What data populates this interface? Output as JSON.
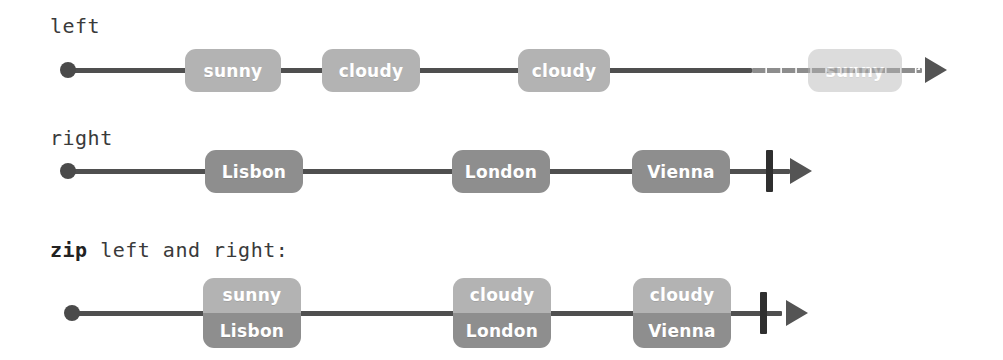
{
  "diagram": {
    "colors": {
      "marble_left": "#b3b3b3",
      "marble_right": "#8e8e8e",
      "line": "#4f4f4f",
      "dot": "#4a4a4a",
      "arrow": "#545454",
      "complete_bar": "#2f2f2f",
      "label_text": "#3a3a3a",
      "marble_text": "#ffffff",
      "background": "#ffffff"
    },
    "rows": [
      {
        "id": "left",
        "label_plain": "left",
        "label_keyword": "",
        "label_rest": "left",
        "completed": false,
        "dashed_tail": true,
        "marbles": [
          {
            "id": "left-sunny-1",
            "lines": [
              "sunny"
            ],
            "tone": "left",
            "faded": false
          },
          {
            "id": "left-cloudy-1",
            "lines": [
              "cloudy"
            ],
            "tone": "left",
            "faded": false
          },
          {
            "id": "left-cloudy-2",
            "lines": [
              "cloudy"
            ],
            "tone": "left",
            "faded": false
          },
          {
            "id": "left-sunny-2",
            "lines": [
              "sunny"
            ],
            "tone": "left",
            "faded": true
          }
        ]
      },
      {
        "id": "right",
        "label_plain": "right",
        "label_keyword": "",
        "label_rest": "right",
        "completed": true,
        "dashed_tail": false,
        "marbles": [
          {
            "id": "right-lisbon",
            "lines": [
              "Lisbon"
            ],
            "tone": "right",
            "faded": false
          },
          {
            "id": "right-london",
            "lines": [
              "London"
            ],
            "tone": "right",
            "faded": false
          },
          {
            "id": "right-vienna",
            "lines": [
              "Vienna"
            ],
            "tone": "right",
            "faded": false
          }
        ]
      },
      {
        "id": "zip",
        "label_plain": "zip left and right:",
        "label_keyword": "zip",
        "label_rest": " left and right:",
        "completed": true,
        "dashed_tail": false,
        "marbles": [
          {
            "id": "zip-1",
            "lines": [
              "sunny",
              "Lisbon"
            ],
            "tone": "pair",
            "faded": false
          },
          {
            "id": "zip-2",
            "lines": [
              "cloudy",
              "London"
            ],
            "tone": "pair",
            "faded": false
          },
          {
            "id": "zip-3",
            "lines": [
              "cloudy",
              "Vienna"
            ],
            "tone": "pair",
            "faded": false
          }
        ]
      }
    ]
  },
  "layout": {
    "rows": [
      {
        "label_x": 50,
        "label_y": 14,
        "axis_y": 70,
        "dot_x": 60,
        "axis_start": 68,
        "axis_end": 922,
        "dash_from": 752,
        "arrow_x": 925,
        "bar_x": null,
        "marbles": [
          {
            "x": 185,
            "w": 96
          },
          {
            "x": 322,
            "w": 98
          },
          {
            "x": 518,
            "w": 92
          },
          {
            "x": 808,
            "w": 94
          }
        ]
      },
      {
        "label_x": 50,
        "label_y": 126,
        "axis_y": 171,
        "dot_x": 60,
        "axis_start": 68,
        "axis_end": 790,
        "dash_from": null,
        "arrow_x": 790,
        "bar_x": 766,
        "marbles": [
          {
            "x": 205,
            "w": 98
          },
          {
            "x": 452,
            "w": 98
          },
          {
            "x": 632,
            "w": 98
          }
        ]
      },
      {
        "label_x": 50,
        "label_y": 238,
        "axis_y": 313,
        "dot_x": 64,
        "axis_start": 72,
        "axis_end": 782,
        "dash_from": null,
        "arrow_x": 786,
        "bar_x": 760,
        "marbles": [
          {
            "x": 203,
            "w": 98
          },
          {
            "x": 453,
            "w": 98
          },
          {
            "x": 633,
            "w": 98
          }
        ]
      }
    ]
  }
}
